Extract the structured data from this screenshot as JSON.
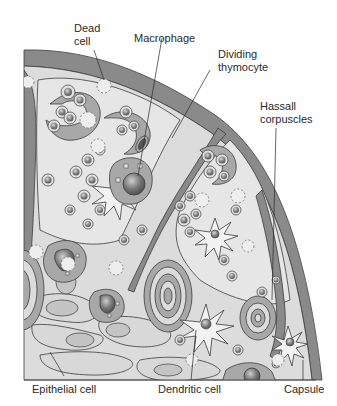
{
  "diagram": {
    "labels": {
      "dead_cell": "Dead\ncell",
      "macrophage": "Macrophage",
      "dividing_thymocyte": "Dividing\nthymocyte",
      "hassall_corpuscles": "Hassall\ncorpuscles",
      "epithelial_cell": "Epithelial cell",
      "dendritic_cell": "Dendritic cell",
      "capsule": "Capsule"
    },
    "colors": {
      "capsule": "#8a8a8a",
      "tissue_background": "#dcdcdc",
      "lobule_fill": "#e6e6e6",
      "cell_fill": "#a8a8a8",
      "nucleus": "#6a6a6a",
      "outline": "#3c3c3c",
      "dead_cell_outline": "#7a7a7a",
      "label_text": "#2a2a2a"
    }
  }
}
